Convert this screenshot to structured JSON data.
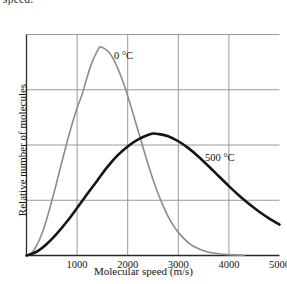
{
  "top_caption": "speed.",
  "chart_data": {
    "type": "line",
    "title": "",
    "xlabel": "Molecular speed (m/s)",
    "ylabel": "Relative number of molecules",
    "xlim": [
      0,
      5000
    ],
    "ylim": [
      0,
      1.06
    ],
    "grid": true,
    "legend_position": "inline-annotation",
    "xticks": [
      1000,
      2000,
      3000,
      4000,
      5000
    ],
    "xtick_labels": [
      "1000",
      "2000",
      "3000",
      "4000",
      "5000"
    ],
    "yticks": [],
    "ytick_labels": [],
    "gridlines": {
      "vertical_at": [
        1000,
        2000,
        3000,
        4000
      ],
      "horizontal_count": 4
    },
    "series": [
      {
        "name": "0 °C",
        "label": "0 °C",
        "color": "#8c8c8c",
        "line_width": 1.6,
        "peak": {
          "x": 1450,
          "y": 1.0
        },
        "x": [
          0,
          100,
          200,
          300,
          400,
          500,
          600,
          700,
          800,
          900,
          1000,
          1100,
          1200,
          1300,
          1400,
          1450,
          1500,
          1600,
          1700,
          1800,
          1900,
          2000,
          2100,
          2200,
          2300,
          2400,
          2500,
          2600,
          2700,
          2800,
          2900,
          3000,
          3200,
          3400,
          3600,
          3800,
          4000,
          4200,
          4300
        ],
        "y": [
          0.0,
          0.012,
          0.047,
          0.102,
          0.175,
          0.261,
          0.354,
          0.45,
          0.543,
          0.63,
          0.708,
          0.774,
          0.857,
          0.93,
          0.982,
          1.0,
          0.998,
          0.982,
          0.95,
          0.9,
          0.838,
          0.765,
          0.686,
          0.603,
          0.52,
          0.44,
          0.365,
          0.297,
          0.238,
          0.187,
          0.145,
          0.111,
          0.061,
          0.032,
          0.016,
          0.008,
          0.004,
          0.002,
          0.001
        ]
      },
      {
        "name": "500 °C",
        "label": "500 °C",
        "color": "#151515",
        "line_width": 2.6,
        "peak": {
          "x": 2500,
          "y": 0.585
        },
        "x": [
          0,
          200,
          400,
          600,
          800,
          1000,
          1200,
          1400,
          1600,
          1800,
          2000,
          2200,
          2400,
          2500,
          2600,
          2800,
          3000,
          3200,
          3400,
          3600,
          3800,
          4000,
          4200,
          4400,
          4600,
          4800,
          5000
        ],
        "y": [
          0.0,
          0.018,
          0.055,
          0.105,
          0.163,
          0.228,
          0.295,
          0.36,
          0.425,
          0.48,
          0.523,
          0.556,
          0.578,
          0.585,
          0.583,
          0.572,
          0.548,
          0.515,
          0.474,
          0.428,
          0.38,
          0.333,
          0.288,
          0.247,
          0.21,
          0.177,
          0.148
        ]
      }
    ]
  }
}
